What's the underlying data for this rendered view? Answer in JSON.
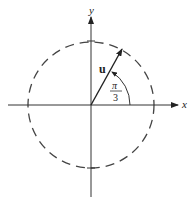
{
  "diagram": {
    "x_axis_label": "x",
    "y_axis_label": "y",
    "vector_label": "u",
    "angle_numerator": "π",
    "angle_denominator": "3",
    "circle_style": "dashed",
    "stroke_color": "#333333"
  }
}
